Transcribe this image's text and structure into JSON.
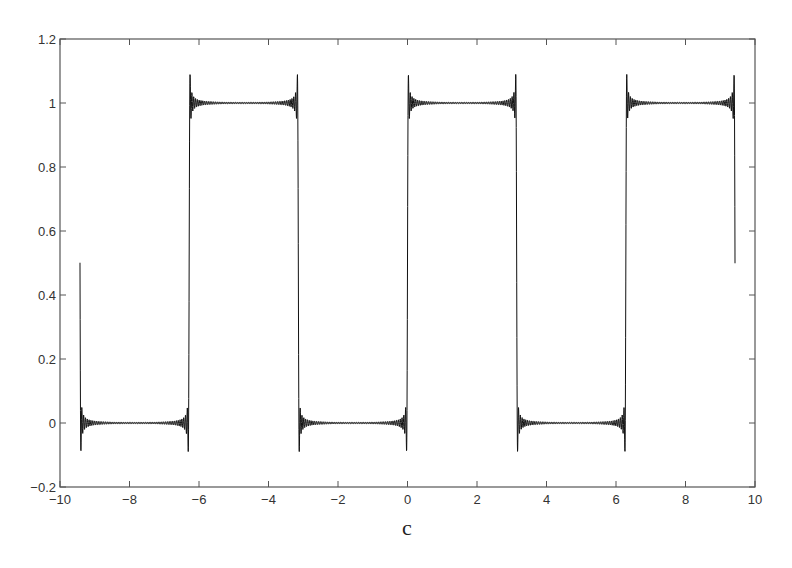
{
  "chart_data": {
    "type": "line",
    "title": "",
    "xlabel": "",
    "ylabel": "",
    "caption": "c",
    "xlim": [
      -10,
      10
    ],
    "ylim": [
      -0.2,
      1.2
    ],
    "x_ticks": [
      -10,
      -8,
      -6,
      -4,
      -2,
      0,
      2,
      4,
      6,
      8,
      10
    ],
    "x_tick_labels": [
      "−10",
      "−8",
      "−6",
      "−4",
      "−2",
      "0",
      "2",
      "4",
      "6",
      "8",
      "10"
    ],
    "y_ticks": [
      -0.2,
      0,
      0.2,
      0.4,
      0.6,
      0.8,
      1,
      1.2
    ],
    "y_tick_labels": [
      "−0.2",
      "0",
      "0.2",
      "0.4",
      "0.6",
      "0.8",
      "1",
      "1.2"
    ],
    "grid": false,
    "legend": null,
    "series": [
      {
        "name": "Fourier partial sum of square wave",
        "description": "Square wave equal to 1 on (-2π,-π), (0,π), (2π,3π) and 0 elsewhere, approximated by a truncated Fourier series showing Gibbs overshoot (~1.09 and ~-0.09) at each jump",
        "x_range": [
          -9.4248,
          9.4248
        ],
        "formula": "0.5 + (2/pi) * sum_{k=1..N} sin((2k-1)x)/(2k-1)",
        "terms": 60,
        "samples": 4000,
        "color": "#111111",
        "key_points": [
          {
            "x": -9.42,
            "y": 0.5
          },
          {
            "x": -9.3,
            "y": -0.09
          },
          {
            "x": -7.8,
            "y": 0.0
          },
          {
            "x": -6.28,
            "y": 1.09
          },
          {
            "x": -4.7,
            "y": 1.0
          },
          {
            "x": -3.14,
            "y": -0.09
          },
          {
            "x": -1.6,
            "y": 0.0
          },
          {
            "x": 0.0,
            "y": 1.09
          },
          {
            "x": 1.6,
            "y": 1.0
          },
          {
            "x": 3.14,
            "y": -0.09
          },
          {
            "x": 4.7,
            "y": 0.0
          },
          {
            "x": 6.28,
            "y": 1.09
          },
          {
            "x": 7.8,
            "y": 1.0
          },
          {
            "x": 9.42,
            "y": 0.78
          }
        ]
      }
    ]
  },
  "layout": {
    "plot_left": 60,
    "plot_right": 755,
    "plot_top": 39,
    "plot_bottom": 487
  }
}
